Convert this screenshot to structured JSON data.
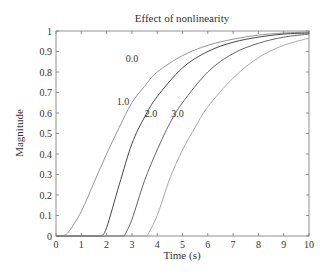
{
  "chart_data": {
    "type": "line",
    "title": "Effect of nonlinearity",
    "xlabel": "Time (s)",
    "ylabel": "Magnitude",
    "xlim": [
      0,
      10
    ],
    "ylim": [
      0,
      1
    ],
    "xticks": [
      0,
      1,
      2,
      3,
      4,
      5,
      6,
      7,
      8,
      9,
      10
    ],
    "yticks": [
      0,
      0.1,
      0.2,
      0.3,
      0.4,
      0.5,
      0.6,
      0.7,
      0.8,
      0.9,
      1
    ],
    "ytick_labels": [
      "0",
      "0.1",
      "0.2",
      "0.3",
      "0.4",
      "0.5",
      "0.6",
      "0.7",
      "0.8",
      "0.9",
      "1"
    ],
    "grid": false,
    "legend": "inline curve labels",
    "series": [
      {
        "name": "0.0",
        "color": "#8a8a8a",
        "x": [
          0,
          0.2,
          0.5,
          1,
          1.5,
          2,
          2.5,
          3,
          3.5,
          4,
          5,
          6,
          7,
          8,
          9,
          10
        ],
        "y": [
          0,
          0,
          0.02,
          0.12,
          0.26,
          0.4,
          0.53,
          0.65,
          0.73,
          0.8,
          0.88,
          0.93,
          0.96,
          0.98,
          0.99,
          0.995
        ],
        "label_pos": [
          3.0,
          0.85
        ]
      },
      {
        "name": "1.0",
        "color": "#333333",
        "x": [
          1.8,
          2,
          2.5,
          3,
          3.5,
          4,
          5,
          6,
          7,
          8,
          9,
          10
        ],
        "y": [
          0,
          0.04,
          0.25,
          0.45,
          0.58,
          0.68,
          0.82,
          0.9,
          0.945,
          0.97,
          0.985,
          0.99
        ],
        "label_pos": [
          2.65,
          0.64
        ]
      },
      {
        "name": "2.0",
        "color": "#555555",
        "x": [
          2.7,
          3,
          3.5,
          4,
          4.5,
          5,
          6,
          7,
          8,
          9,
          10
        ],
        "y": [
          0,
          0.08,
          0.27,
          0.42,
          0.55,
          0.65,
          0.8,
          0.89,
          0.94,
          0.97,
          0.985
        ],
        "label_pos": [
          3.75,
          0.58
        ]
      },
      {
        "name": "3.0",
        "color": "#a0a0a0",
        "x": [
          3.6,
          4,
          4.5,
          5,
          5.5,
          6,
          7,
          8,
          9,
          10
        ],
        "y": [
          0,
          0.1,
          0.28,
          0.42,
          0.53,
          0.63,
          0.77,
          0.87,
          0.93,
          0.965
        ],
        "label_pos": [
          4.8,
          0.58
        ]
      }
    ]
  }
}
